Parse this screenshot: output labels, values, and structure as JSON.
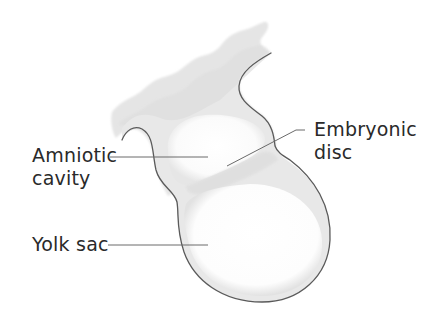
{
  "diagram": {
    "labels": {
      "amniotic_line1": "Amniotic",
      "amniotic_line2": "cavity",
      "embryonic_line1": "Embryonic",
      "embryonic_line2": "disc",
      "yolk_sac": "Yolk sac"
    },
    "colors": {
      "outline": "#5a5a5a",
      "tissue_fill": "#e4e4e4",
      "cavity_fill": "#ffffff",
      "leader_line": "#6a6a6a",
      "text": "#2a2a2a"
    }
  }
}
